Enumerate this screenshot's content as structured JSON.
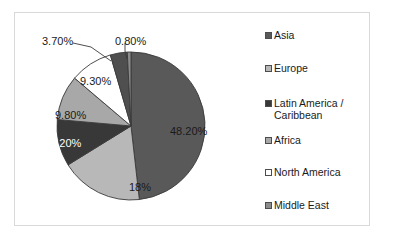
{
  "chart_data": {
    "type": "pie",
    "title": "",
    "subtitle": "",
    "xlabel": "",
    "ylabel": "",
    "grid": false,
    "legend_position": "right",
    "categories": [
      "Asia",
      "Europe",
      "Latin America / Caribbean",
      "Africa",
      "North America",
      "Middle East"
    ],
    "values": [
      48.2,
      18.0,
      10.2,
      9.8,
      9.3,
      0.8
    ],
    "slices": [
      {
        "name": "Asia",
        "value": 48.2,
        "label": "48.20%",
        "color": "#595959",
        "label_color": "#1a1a1a",
        "start_angle": 0,
        "sweep": 173.52
      },
      {
        "name": "Europe",
        "value": 18.0,
        "label": "18%",
        "color": "#b8b8b8",
        "label_color": "#1a1a1a",
        "start_angle": 173.52,
        "sweep": 64.8
      },
      {
        "name": "Latin America / Caribbean",
        "value": 10.2,
        "label": "10.20%",
        "color": "#383838",
        "label_color": "#ffffff",
        "start_angle": 238.32,
        "sweep": 36.72
      },
      {
        "name": "Africa",
        "value": 9.8,
        "label": "9.80%",
        "color": "#a8a8a8",
        "label_color": "#1a1a1a",
        "start_angle": 275.04,
        "sweep": 35.28
      },
      {
        "name": "North America",
        "value": 9.3,
        "label": "9.30%",
        "color": "#ffffff",
        "label_color": "#1a1a1a",
        "start_angle": 310.32,
        "sweep": 33.48
      },
      {
        "name": "Unlabeled region",
        "value": 3.7,
        "label": "3.70%",
        "color": "#4f4f4f",
        "label_color": "#1a1a1a",
        "start_angle": 343.8,
        "sweep": 13.32
      },
      {
        "name": "Middle East",
        "value": 0.8,
        "label": "0.80%",
        "color": "#8c8c8c",
        "label_color": "#1a1a1a",
        "start_angle": 357.12,
        "sweep": 2.88
      }
    ],
    "data_labels": [
      {
        "text": "3.70%",
        "x": 27,
        "y": 22
      },
      {
        "text": "0.80%",
        "x": 100,
        "y": 22
      },
      {
        "text": "9.30%",
        "x": 65,
        "y": 62
      },
      {
        "text": "9.80%",
        "x": 40,
        "y": 96
      },
      {
        "text": "10.20%",
        "x": 29,
        "y": 124
      },
      {
        "text": "18%",
        "x": 114,
        "y": 168
      },
      {
        "text": "48.20%",
        "x": 155,
        "y": 112
      }
    ]
  },
  "legend": {
    "items": [
      {
        "label": "Asia",
        "color": "#595959",
        "top": 0
      },
      {
        "label": "Europe",
        "color": "#b8b8b8",
        "top": 33
      },
      {
        "label": "Latin America /\nCaribbean",
        "color": "#383838",
        "top": 68
      },
      {
        "label": "Africa",
        "color": "#a8a8a8",
        "top": 105
      },
      {
        "label": "North America",
        "color": "#ffffff",
        "top": 137
      },
      {
        "label": "Middle East",
        "color": "#8c8c8c",
        "top": 170
      }
    ]
  },
  "colors": {
    "frame_border": "#d9d9d9",
    "page_background": "#ffffff",
    "slice_outline": "#3a3a3a",
    "leader_line": "#3a3a3a",
    "text": "#1a1a1a"
  }
}
